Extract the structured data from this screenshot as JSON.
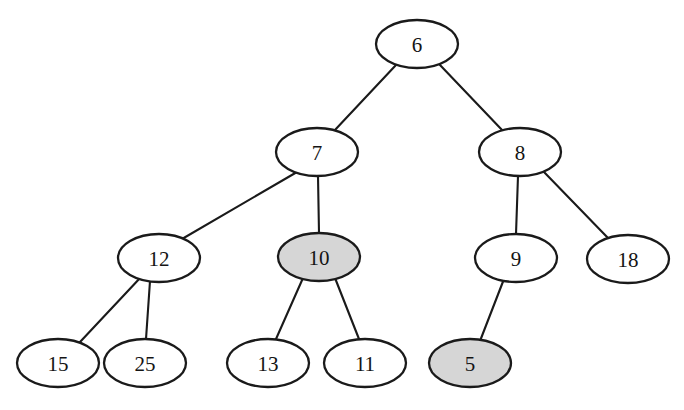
{
  "diagram": {
    "type": "tree",
    "background_color": "#ffffff",
    "stroke_color": "#1a1a1a",
    "node_fill_default": "#ffffff",
    "node_fill_highlight": "#d6d6d6",
    "label_color": "#141414"
  },
  "nodes": [
    {
      "id": "n6",
      "label": "6",
      "cx": 417,
      "cy": 44,
      "rx": 41,
      "ry": 24,
      "highlighted": false,
      "fill": "#ffffff"
    },
    {
      "id": "n7",
      "label": "7",
      "cx": 317,
      "cy": 152,
      "rx": 41,
      "ry": 24,
      "highlighted": false,
      "fill": "#ffffff"
    },
    {
      "id": "n8",
      "label": "8",
      "cx": 520,
      "cy": 152,
      "rx": 41,
      "ry": 24,
      "highlighted": false,
      "fill": "#ffffff"
    },
    {
      "id": "n12",
      "label": "12",
      "cx": 159,
      "cy": 258,
      "rx": 41,
      "ry": 24,
      "highlighted": false,
      "fill": "#ffffff"
    },
    {
      "id": "n10",
      "label": "10",
      "cx": 319,
      "cy": 257,
      "rx": 41,
      "ry": 24,
      "highlighted": true,
      "fill": "#d6d6d6"
    },
    {
      "id": "n9",
      "label": "9",
      "cx": 516,
      "cy": 258,
      "rx": 41,
      "ry": 24,
      "highlighted": false,
      "fill": "#ffffff"
    },
    {
      "id": "n18",
      "label": "18",
      "cx": 628,
      "cy": 259,
      "rx": 41,
      "ry": 24,
      "highlighted": false,
      "fill": "#ffffff"
    },
    {
      "id": "n15",
      "label": "15",
      "cx": 58,
      "cy": 363,
      "rx": 41,
      "ry": 24,
      "highlighted": false,
      "fill": "#ffffff"
    },
    {
      "id": "n25",
      "label": "25",
      "cx": 145,
      "cy": 363,
      "rx": 41,
      "ry": 24,
      "highlighted": false,
      "fill": "#ffffff"
    },
    {
      "id": "n13",
      "label": "13",
      "cx": 268,
      "cy": 363,
      "rx": 41,
      "ry": 24,
      "highlighted": false,
      "fill": "#ffffff"
    },
    {
      "id": "n11",
      "label": "11",
      "cx": 365,
      "cy": 363,
      "rx": 41,
      "ry": 24,
      "highlighted": false,
      "fill": "#ffffff"
    },
    {
      "id": "n5",
      "label": "5",
      "cx": 470,
      "cy": 363,
      "rx": 41,
      "ry": 24,
      "highlighted": true,
      "fill": "#d6d6d6"
    }
  ],
  "edges": [
    {
      "id": "e6-7",
      "from": "6",
      "to": "7",
      "x1": 396,
      "y1": 65,
      "x2": 334,
      "y2": 131
    },
    {
      "id": "e6-8",
      "from": "6",
      "to": "8",
      "x1": 440,
      "y1": 65,
      "x2": 503,
      "y2": 131
    },
    {
      "id": "e7-12",
      "from": "7",
      "to": "12",
      "x1": 297,
      "y1": 172,
      "x2": 182,
      "y2": 239
    },
    {
      "id": "e7-10",
      "from": "7",
      "to": "10",
      "x1": 318,
      "y1": 176,
      "x2": 319,
      "y2": 233
    },
    {
      "id": "e8-9",
      "from": "8",
      "to": "9",
      "x1": 518,
      "y1": 176,
      "x2": 516,
      "y2": 234
    },
    {
      "id": "e8-18",
      "from": "8",
      "to": "18",
      "x1": 543,
      "y1": 171,
      "x2": 608,
      "y2": 238
    },
    {
      "id": "e12-15",
      "from": "12",
      "to": "15",
      "x1": 141,
      "y1": 277,
      "x2": 80,
      "y2": 342
    },
    {
      "id": "e12-25",
      "from": "12",
      "to": "25",
      "x1": 150,
      "y1": 281,
      "x2": 146,
      "y2": 339
    },
    {
      "id": "e10-13",
      "from": "10",
      "to": "13",
      "x1": 303,
      "y1": 278,
      "x2": 276,
      "y2": 339
    },
    {
      "id": "e10-11",
      "from": "10",
      "to": "11",
      "x1": 335,
      "y1": 278,
      "x2": 359,
      "y2": 339
    },
    {
      "id": "e9-5",
      "from": "9",
      "to": "5",
      "x1": 504,
      "y1": 279,
      "x2": 480,
      "y2": 341
    }
  ]
}
